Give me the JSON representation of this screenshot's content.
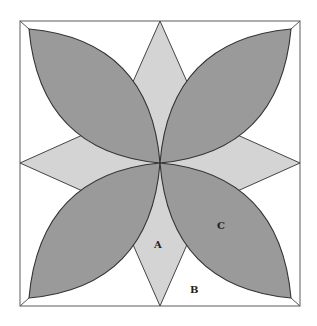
{
  "figure": {
    "labels": {
      "a": "A",
      "b": "B",
      "c": "C"
    },
    "colors": {
      "leaf": "#9a9a9a",
      "star": "#d4d4d4",
      "background": "#ffffff",
      "stroke": "#333333"
    }
  }
}
